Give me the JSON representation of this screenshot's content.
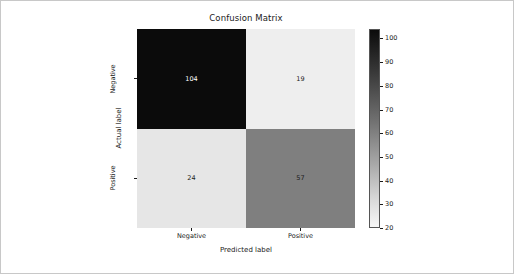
{
  "figure": {
    "title": "Confusion Matrix",
    "background": "#ffffff",
    "frame_color": "#c8c8c8"
  },
  "chart_data": {
    "type": "heatmap",
    "title": "Confusion Matrix",
    "xlabel": "Predicted label",
    "ylabel": "Actual label",
    "x_categories": [
      "Negative",
      "Positive"
    ],
    "y_categories": [
      "Negative",
      "Positive"
    ],
    "matrix": [
      [
        104,
        19
      ],
      [
        24,
        57
      ]
    ],
    "cells": [
      {
        "row": 0,
        "col": 0,
        "value": "104",
        "fill": "#0b0b0b",
        "text_color": "#ffffff"
      },
      {
        "row": 0,
        "col": 1,
        "value": "19",
        "fill": "#eeeeee",
        "text_color": "#1a1a1a"
      },
      {
        "row": 1,
        "col": 0,
        "value": "24",
        "fill": "#e6e6e6",
        "text_color": "#1a1a1a"
      },
      {
        "row": 1,
        "col": 1,
        "value": "57",
        "fill": "#7f7f7f",
        "text_color": "#1a1a1a"
      }
    ],
    "colormap": "greys",
    "colorbar": {
      "vmin": 20,
      "vmax": 104,
      "ticks": [
        "100",
        "90",
        "80",
        "70",
        "60",
        "50",
        "40",
        "30",
        "20"
      ],
      "tick_values": [
        100,
        90,
        80,
        70,
        60,
        50,
        40,
        30,
        20
      ],
      "position": "right",
      "gradient_top": "#0b0b0b",
      "gradient_bottom": "#f7f7f7"
    },
    "grid": false,
    "legend": "none"
  }
}
